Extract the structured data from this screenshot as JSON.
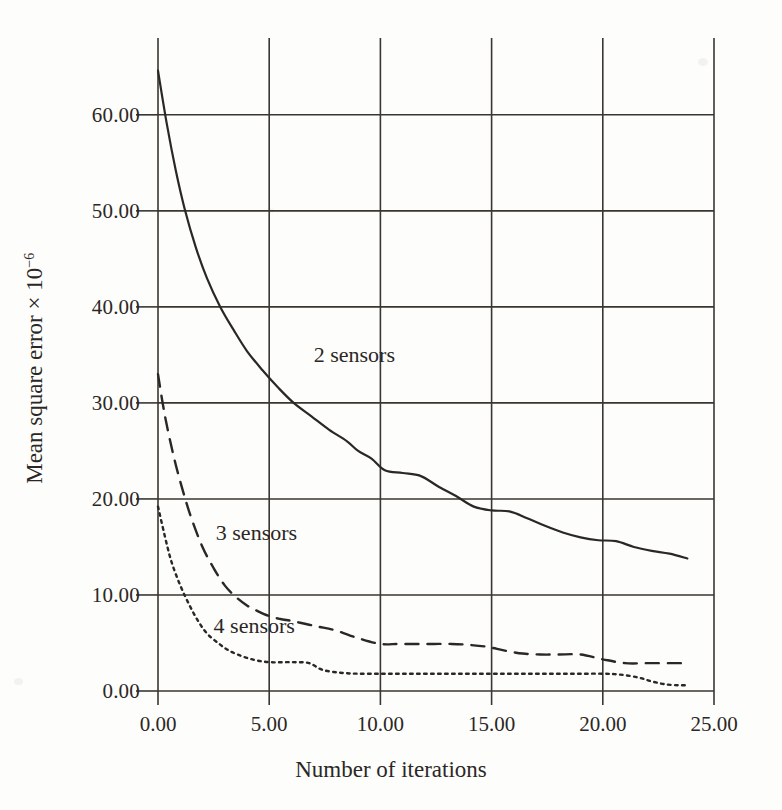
{
  "figure": {
    "background_color": "#fdfdfc",
    "axis_color": "#3a3632",
    "curve_color": "#2b2724"
  },
  "chart_data": {
    "type": "line",
    "title": "",
    "xlabel": "Number of iterations",
    "ylabel": "Mean square error × 10",
    "ylabel_exponent": "−6",
    "xlim": [
      0,
      25
    ],
    "ylim": [
      0,
      68
    ],
    "grid": true,
    "legend_position": "inline-annotations",
    "xticks": [
      0,
      5,
      10,
      15,
      20,
      25
    ],
    "xtick_labels": [
      "0.00",
      "5.00",
      "10.00",
      "15.00",
      "20.00",
      "25.00"
    ],
    "yticks": [
      0,
      10,
      20,
      30,
      40,
      50,
      60
    ],
    "ytick_labels": [
      "0.00",
      "10.00",
      "20.00",
      "30.00",
      "40.00",
      "50.00",
      "60.00"
    ],
    "series": [
      {
        "name": "2 sensors",
        "style": "solid",
        "label_x": 7.0,
        "label_y": 34.8,
        "x": [
          0.0,
          0.4,
          0.8,
          1.2,
          1.7,
          2.2,
          2.8,
          3.4,
          4.0,
          4.7,
          5.4,
          6.1,
          6.9,
          7.7,
          8.5,
          9.0,
          9.6,
          10.2,
          11.0,
          11.8,
          12.6,
          13.4,
          14.2,
          15.0,
          15.8,
          16.6,
          17.4,
          18.2,
          19.0,
          19.8,
          20.6,
          21.4,
          22.2,
          23.0,
          23.8
        ],
        "y": [
          64.6,
          59.0,
          54.2,
          50.2,
          46.2,
          43.0,
          40.0,
          37.6,
          35.4,
          33.4,
          31.6,
          30.0,
          28.6,
          27.2,
          26.0,
          25.0,
          24.2,
          23.0,
          22.7,
          22.4,
          21.3,
          20.3,
          19.2,
          18.8,
          18.7,
          18.0,
          17.2,
          16.5,
          16.0,
          15.7,
          15.6,
          15.0,
          14.6,
          14.3,
          13.8
        ]
      },
      {
        "name": "3 sensors",
        "style": "dashed",
        "label_x": 2.6,
        "label_y": 16.2,
        "x": [
          0.0,
          0.3,
          0.7,
          1.1,
          1.5,
          2.0,
          2.5,
          3.0,
          3.5,
          4.0,
          4.5,
          5.0,
          5.5,
          6.0,
          6.6,
          7.2,
          8.0,
          9.0,
          10.0,
          10.8,
          11.6,
          12.4,
          13.2,
          14.0,
          14.8,
          15.6,
          16.4,
          17.2,
          18.0,
          19.0,
          20.0,
          21.0,
          22.0,
          23.0,
          23.8
        ],
        "y": [
          33.0,
          28.8,
          24.5,
          21.0,
          18.0,
          15.0,
          12.8,
          11.0,
          9.8,
          8.9,
          8.3,
          7.8,
          7.5,
          7.3,
          7.0,
          6.7,
          6.3,
          5.5,
          4.9,
          4.9,
          4.9,
          4.9,
          4.9,
          4.8,
          4.6,
          4.2,
          3.9,
          3.8,
          3.8,
          3.8,
          3.3,
          2.9,
          2.9,
          2.9,
          2.9
        ]
      },
      {
        "name": "4 sensors",
        "style": "dotted",
        "label_x": 2.5,
        "label_y": 6.6,
        "x": [
          0.0,
          0.3,
          0.6,
          1.0,
          1.4,
          1.8,
          2.2,
          2.7,
          3.2,
          3.8,
          4.4,
          5.0,
          5.6,
          6.2,
          6.8,
          7.4,
          8.2,
          9.0,
          10.0,
          11.0,
          12.0,
          13.0,
          14.0,
          15.0,
          16.0,
          17.0,
          18.0,
          19.0,
          20.0,
          20.8,
          21.6,
          22.2,
          22.8,
          23.4,
          23.8
        ],
        "y": [
          19.2,
          16.2,
          13.5,
          11.0,
          9.0,
          7.3,
          6.0,
          5.0,
          4.2,
          3.6,
          3.2,
          3.0,
          3.0,
          3.0,
          2.9,
          2.2,
          1.9,
          1.8,
          1.8,
          1.8,
          1.8,
          1.8,
          1.8,
          1.8,
          1.8,
          1.8,
          1.8,
          1.8,
          1.8,
          1.7,
          1.4,
          1.0,
          0.7,
          0.6,
          0.6
        ]
      }
    ]
  }
}
